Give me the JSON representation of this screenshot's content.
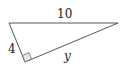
{
  "diagram": {
    "type": "right-triangle",
    "labels": {
      "hypotenuse": "10",
      "short_leg": "4",
      "long_leg": "y"
    },
    "colors": {
      "stroke": "#555555",
      "right_angle_fill": "#e6e6e6",
      "text": "#222222"
    }
  }
}
